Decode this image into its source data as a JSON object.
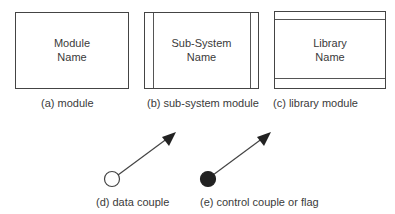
{
  "diagram": {
    "module": {
      "line1": "Module",
      "line2": "Name",
      "caption": "(a) module"
    },
    "subsystem": {
      "line1": "Sub-System",
      "line2": "Name",
      "caption": "(b) sub-system module"
    },
    "library": {
      "line1": "Library",
      "line2": "Name",
      "caption": "(c) library module"
    },
    "data_couple": {
      "icon": "open-circle-arrow-icon",
      "caption": "(d) data couple"
    },
    "control_couple": {
      "icon": "filled-circle-arrow-icon",
      "caption": "(e) control couple or flag"
    },
    "colors": {
      "stroke": "#444444",
      "fill_dark": "#222222",
      "text": "#3a3a3a"
    }
  }
}
